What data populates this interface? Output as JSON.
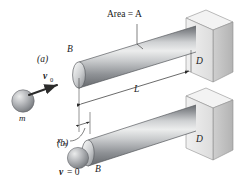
{
  "figure": {
    "title": "",
    "background_color": "#ffffff",
    "ink_color": "#1a1a1a"
  },
  "labels": {
    "area": "Area = A",
    "panel_a": "(a)",
    "panel_b": "(b)",
    "velocity_initial": "v",
    "velocity_initial_sub": "0",
    "mass": "m",
    "rod_end_upper": "B",
    "rod_end_lower": "B",
    "wall_upper": "D",
    "wall_lower": "D",
    "length": "L",
    "deflection": "x",
    "deflection_sub": "m",
    "velocity_zero": "v = 0",
    "velocity_zero_v": "v",
    "velocity_zero_rest": "= 0"
  },
  "colors": {
    "rod_dark": "#6f7276",
    "rod_mid": "#9a9da1",
    "rod_light": "#e8e9ea",
    "rod_edge": "#55585c",
    "wall_front": "#e2e2e2",
    "wall_side": "#c4c4c4",
    "wall_top": "#f0f0f0",
    "wall_edge": "#8a8a8a",
    "sphere_light": "#d8d9da",
    "sphere_dark": "#7c7f83",
    "arrow": "#2b2b2b",
    "dim_line": "#3a3a3a"
  },
  "geometry": {
    "rod_upper_label": "upper-rod-cylinder",
    "rod_lower_label": "lower-rod-cylinder",
    "length_dimension": "L",
    "deflection_dimension": "x_m"
  }
}
